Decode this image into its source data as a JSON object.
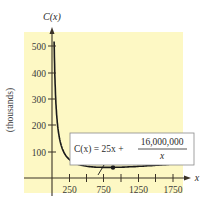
{
  "chart_data": {
    "type": "line",
    "title": "",
    "xlabel": "x",
    "ylabel": "C(x)",
    "y_unit_label": "(thousands)",
    "xlim": [
      0,
      1900
    ],
    "ylim": [
      0,
      560
    ],
    "x_ticks": [
      250,
      500,
      750,
      1000,
      1250,
      1500,
      1750
    ],
    "x_tick_labels": [
      "250",
      "750",
      "1250",
      "1750"
    ],
    "y_ticks": [
      100,
      200,
      300,
      400,
      500
    ],
    "y_tick_labels": [
      "100",
      "200",
      "300",
      "400",
      "500"
    ],
    "grid": false,
    "series": [
      {
        "name": "C(x) = 25x + 16,000,000/x",
        "function": "25x + 16000000/x (in thousands)",
        "x": [
          30,
          40,
          50,
          75,
          100,
          150,
          200,
          300,
          400,
          500,
          600,
          800,
          1000,
          1250,
          1500,
          1750,
          1850
        ],
        "values": [
          534,
          401,
          321,
          215,
          163,
          110,
          85,
          61,
          50,
          45,
          42,
          40,
          41,
          44,
          48,
          53,
          55
        ]
      }
    ],
    "annotations": [
      {
        "text": "(800, 40)",
        "x": 800,
        "y": 40,
        "type": "minimum-point"
      },
      {
        "text": "C(x) = 25x + 16,000,000 / x",
        "type": "formula-box"
      }
    ],
    "background_color": "#fdf8c4",
    "curve_color": "#1a1a1a"
  },
  "labels": {
    "y_axis_title": "C(x)",
    "x_axis_title": "x",
    "y_unit": "(thousands)",
    "tick_250": "250",
    "tick_750": "750",
    "tick_1250": "1250",
    "tick_1750": "1750",
    "tick_100": "100",
    "tick_200": "200",
    "tick_300": "300",
    "tick_400": "400",
    "tick_500": "500",
    "min_point": "(800, 40)",
    "formula_lhs": "C(x) = 25x + ",
    "formula_num": "16,000,000",
    "formula_den": "x"
  }
}
